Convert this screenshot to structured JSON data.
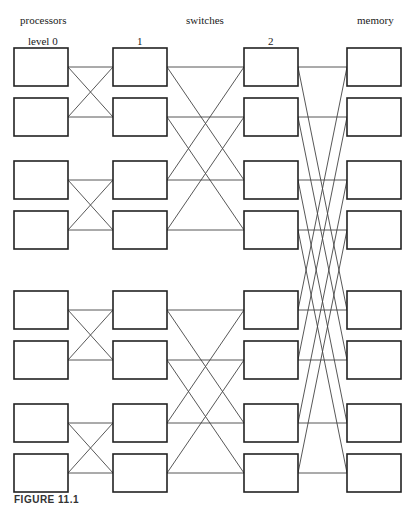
{
  "headers": {
    "processors": "processors",
    "switches": "switches",
    "memory": "memory"
  },
  "levels": {
    "level0": "level 0",
    "level1": "1",
    "level2": "2"
  },
  "caption": "FIGURE 11.1",
  "layout": {
    "columns_x": [
      14,
      113,
      244,
      347
    ],
    "box_width": 54,
    "box_height": 38,
    "rows_y": [
      48,
      98,
      161,
      211,
      291,
      341,
      404,
      454
    ]
  },
  "network": {
    "type": "butterfly (omega-style) multistage interconnection",
    "nodes_per_column": 8,
    "columns": [
      "processors",
      "switch level 1",
      "switch level 2",
      "memory"
    ],
    "stages": [
      {
        "from": "level 0",
        "to": "level 1",
        "pairing": "i <-> i xor 1"
      },
      {
        "from": "level 1",
        "to": "level 2",
        "pairing": "i <-> i xor 2"
      },
      {
        "from": "level 2",
        "to": "memory",
        "pairing": "i <-> i xor 4"
      }
    ]
  }
}
